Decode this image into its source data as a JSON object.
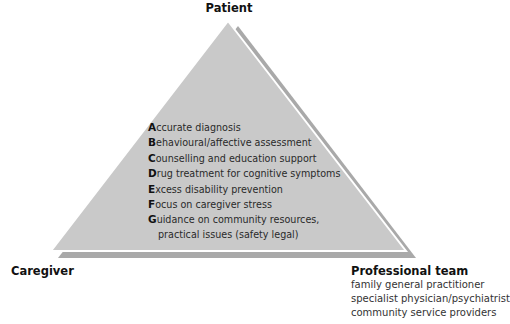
{
  "diagram": {
    "vertices": {
      "top": "Patient",
      "bottom_left": "Caregiver",
      "bottom_right": "Professional team"
    },
    "professional_team_members": [
      "family general practitioner",
      "specialist physician/psychiatrist",
      "community service providers"
    ],
    "abc_items": [
      {
        "letter": "A",
        "rest": "ccurate diagnosis"
      },
      {
        "letter": "B",
        "rest": "ehavioural/affective assessment"
      },
      {
        "letter": "C",
        "rest": "ounselling and education support"
      },
      {
        "letter": "D",
        "rest": "rug treatment for cognitive symptoms"
      },
      {
        "letter": "E",
        "rest": "xcess disability prevention"
      },
      {
        "letter": "F",
        "rest": "ocus on caregiver stress"
      },
      {
        "letter": "G",
        "rest": "uidance on community resources,",
        "continuation": "practical issues (safety legal)"
      }
    ],
    "colors": {
      "triangle_fill": "#c9c9c9",
      "shadow_fill": "#a9a9a9",
      "gap_stroke": "#ffffff"
    }
  }
}
